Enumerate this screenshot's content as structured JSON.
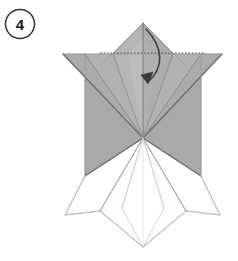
{
  "diagram": {
    "kind": "origami-folding-instruction",
    "step_number": "4",
    "step_badge": {
      "shape": "circle",
      "label": "4",
      "center_x": 20,
      "center_y": 24,
      "radius": 14.5,
      "stroke_color": "#333333",
      "text_color": "#1a1a1a"
    },
    "canvas": {
      "width": 238,
      "height": 261,
      "background": "#ffffff"
    },
    "palette": {
      "paper_front_mid": "#a9a9a9",
      "paper_front_light": "#b4b4b4",
      "paper_front_lighter": "#bdbdbd",
      "paper_front_dark": "#9a9a9a",
      "paper_front_darker": "#8f8f8f",
      "paper_back_white": "#ffffff",
      "paper_back_offwhite": "#fafafa",
      "crease_line": "#6e6e6e",
      "crease_line_soft": "#a0a0a0",
      "outline_light": "#b9b9b9",
      "fold_line_dotted": "#555555",
      "arrow_color": "#3b3b3b"
    },
    "geometry": {
      "top_apex": [
        143,
        23
      ],
      "center_point": [
        143,
        138
      ],
      "left_wing_tip": [
        63,
        54
      ],
      "right_wing_tip": [
        222,
        54
      ],
      "left_body_edge_x": 85,
      "right_body_edge_x": 201,
      "body_bottom_y": 176,
      "bottom_left_tip": [
        65,
        215
      ],
      "bottom_right_tip": [
        220,
        215
      ],
      "bottom_v_point": [
        143,
        247
      ],
      "bottom_inner_left": [
        100,
        211
      ],
      "bottom_inner_right": [
        186,
        211
      ],
      "dotted_fold_y": 53,
      "dotted_fold_x_start": 100,
      "dotted_fold_x_end": 206
    },
    "annotations": {
      "fold_line": {
        "name": "valley-fold-line",
        "style": "dotted",
        "description": "horizontal dotted fold line across top flap"
      },
      "arrow": {
        "name": "fold-down-arrow",
        "style": "curved",
        "direction": "down",
        "start": [
          146,
          29
        ],
        "end": [
          147,
          83
        ],
        "description": "curved arrow indicating the top point folds downward"
      }
    }
  }
}
